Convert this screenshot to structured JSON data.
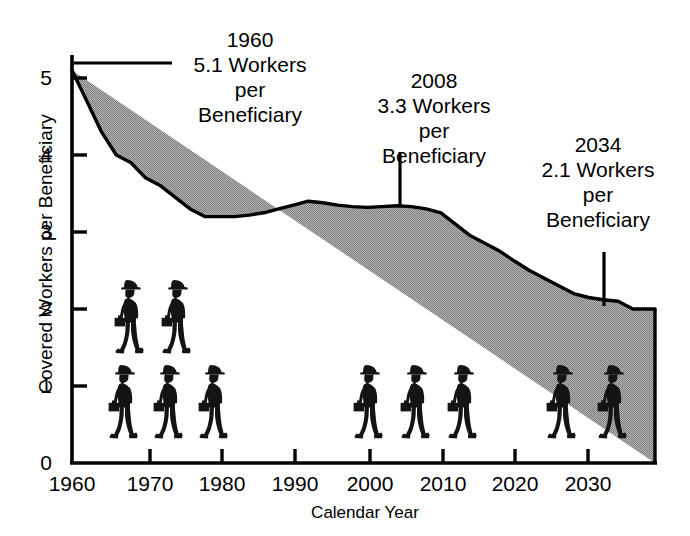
{
  "chart_data": {
    "type": "area",
    "title": "",
    "xlabel": "Calendar Year",
    "ylabel": "Covered Workers per Beneficiary",
    "xlim": [
      1960,
      2039
    ],
    "ylim": [
      0,
      5.4
    ],
    "grid": false,
    "legend": "none",
    "fill_color": "#9a9a9a",
    "line_color": "#000000",
    "xticks": [
      1960,
      1970,
      1980,
      1990,
      2000,
      2010,
      2020,
      2030
    ],
    "xtick_labels": [
      "1960",
      "1970",
      "1980",
      "1990",
      "2000",
      "2010",
      "2020",
      "2030"
    ],
    "yticks": [
      0,
      1,
      2,
      3,
      4,
      5
    ],
    "ytick_labels": [
      "0",
      "1",
      "2",
      "3",
      "4",
      "5"
    ],
    "series": [
      {
        "name": "Covered Workers per Beneficiary",
        "x": [
          1960,
          1962,
          1964,
          1966,
          1968,
          1970,
          1972,
          1974,
          1976,
          1978,
          1980,
          1982,
          1984,
          1986,
          1988,
          1990,
          1992,
          1994,
          1996,
          1998,
          2000,
          2002,
          2004,
          2006,
          2008,
          2010,
          2012,
          2014,
          2016,
          2018,
          2020,
          2022,
          2024,
          2026,
          2028,
          2030,
          2032,
          2034,
          2036,
          2038,
          2039
        ],
        "y": [
          5.1,
          4.7,
          4.3,
          4.0,
          3.9,
          3.7,
          3.6,
          3.45,
          3.3,
          3.2,
          3.2,
          3.2,
          3.22,
          3.25,
          3.3,
          3.35,
          3.4,
          3.38,
          3.35,
          3.33,
          3.32,
          3.33,
          3.34,
          3.33,
          3.3,
          3.25,
          3.1,
          2.95,
          2.85,
          2.75,
          2.62,
          2.5,
          2.4,
          2.3,
          2.2,
          2.15,
          2.12,
          2.1,
          2.0,
          2.0,
          2.0
        ]
      }
    ],
    "annotations": [
      {
        "id": "1960",
        "year": 1960,
        "value": 5.1,
        "lines": [
          "1960",
          "5.1 Workers",
          "per",
          "Beneficiary"
        ],
        "leader": "horizontal"
      },
      {
        "id": "2008",
        "year": 2008,
        "value": 3.3,
        "lines": [
          "2008",
          "3.3 Workers",
          "per",
          "Beneficiary"
        ],
        "leader": "vertical"
      },
      {
        "id": "2034",
        "year": 2034,
        "value": 2.1,
        "lines": [
          "2034",
          "2.1 Workers",
          "per",
          "Beneficiary"
        ],
        "leader": "vertical"
      }
    ],
    "pictograms": [
      {
        "group": "1960",
        "count": 5,
        "icon": "worker-figure",
        "description": "walking worker with hat and lunchbox"
      },
      {
        "group": "2008",
        "count": 3,
        "icon": "worker-figure",
        "description": "walking worker with hat and lunchbox"
      },
      {
        "group": "2034",
        "count": 2,
        "icon": "worker-figure",
        "description": "walking worker with hat and lunchbox"
      }
    ]
  }
}
